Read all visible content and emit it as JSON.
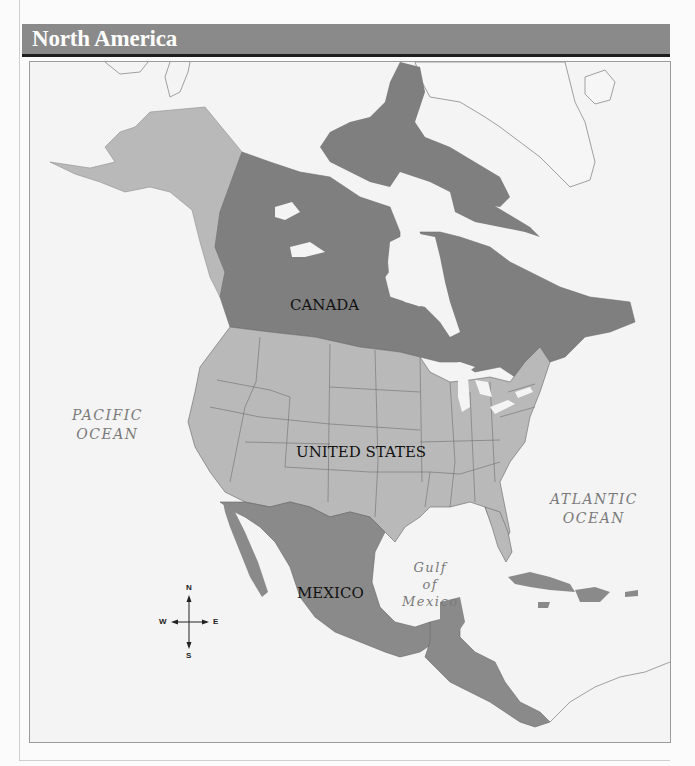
{
  "header": {
    "title": "North America",
    "bar_color": "#8a8a8a",
    "underline_color": "#1e1e1e"
  },
  "map": {
    "colors": {
      "water": "#f4f4f4",
      "us_fill": "#b9b9b9",
      "canada_fill": "#7f7f7f",
      "mexico_central_fill": "#8a8a8a",
      "greenland_outline": "#8a8a8a",
      "border_lines": "#555555"
    },
    "countries": [
      {
        "name": "CANADA"
      },
      {
        "name": "UNITED STATES"
      },
      {
        "name": "MEXICO"
      }
    ],
    "water_bodies": [
      {
        "line1": "PACIFIC",
        "line2": "OCEAN"
      },
      {
        "line1": "ATLANTIC",
        "line2": "OCEAN"
      },
      {
        "line1": "Gulf",
        "line2": "of",
        "line3": "Mexico"
      }
    ],
    "compass": {
      "n": "N",
      "s": "S",
      "e": "E",
      "w": "W"
    }
  }
}
